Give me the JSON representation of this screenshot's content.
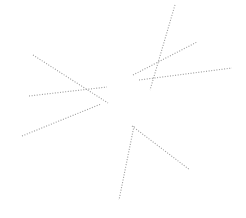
{
  "figure": {
    "title": "",
    "background_color": "#ffffff",
    "width": 246,
    "height": 218,
    "stroke_color": "#9a9a9a",
    "stroke_width": 1.1,
    "dash_pattern": "1,1.6"
  },
  "chart_data": {
    "type": "scatter",
    "title": "",
    "xlabel": "",
    "ylabel": "",
    "xlim": [
      0,
      246
    ],
    "ylim": [
      0,
      218
    ],
    "grid": false,
    "legend": "none",
    "series": [
      {
        "name": "segment-1",
        "cluster": "left",
        "x": [
          33,
          108
        ],
        "y": [
          55,
          103
        ],
        "color": "#9a9a9a"
      },
      {
        "name": "segment-2",
        "cluster": "left",
        "x": [
          29,
          107
        ],
        "y": [
          96,
          87
        ],
        "color": "#9a9a9a"
      },
      {
        "name": "segment-3",
        "cluster": "left",
        "x": [
          22,
          101
        ],
        "y": [
          136,
          104
        ],
        "color": "#9a9a9a"
      },
      {
        "name": "segment-4",
        "cluster": "upper-right",
        "x": [
          175,
          150
        ],
        "y": [
          5,
          90
        ],
        "color": "#9a9a9a"
      },
      {
        "name": "segment-5",
        "cluster": "upper-right",
        "x": [
          133,
          197
        ],
        "y": [
          75,
          42
        ],
        "color": "#9a9a9a"
      },
      {
        "name": "segment-6",
        "cluster": "upper-right",
        "x": [
          139,
          232
        ],
        "y": [
          80,
          68
        ],
        "color": "#9a9a9a"
      },
      {
        "name": "segment-7",
        "cluster": "bottom",
        "x": [
          134,
          119
        ],
        "y": [
          126,
          200
        ],
        "color": "#9a9a9a"
      },
      {
        "name": "segment-8",
        "cluster": "bottom",
        "x": [
          132,
          190
        ],
        "y": [
          126,
          170
        ],
        "color": "#9a9a9a"
      }
    ]
  }
}
